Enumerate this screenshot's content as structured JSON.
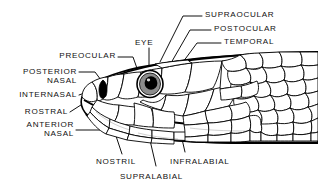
{
  "figure": {
    "background_color": "#ffffff",
    "ink_color": "#000000",
    "width": 318,
    "height": 195
  },
  "labels": {
    "supraocular": "SUPRAOCULAR",
    "postocular": "POSTOCULAR",
    "temporal": "TEMPORAL",
    "eye": "EYE",
    "preocular": "PREOCULAR",
    "posterior_nasal_line1": "POSTERIOR",
    "posterior_nasal_line2": "NASAL",
    "internasal": "INTERNASAL",
    "rostral": "ROSTRAL",
    "anterior_nasal_line1": "ANTERIOR",
    "anterior_nasal_line2": "NASAL",
    "nostril": "NOSTRIL",
    "supralabial": "SUPRALABIAL",
    "infralabial": "INFRALABIAL"
  },
  "anatomy": {
    "eye": {
      "pupil_color": "#000000",
      "iris_color": "#8c8c8c",
      "outline_color": "#000000"
    },
    "nostril": {
      "fill_color": "#000000"
    }
  }
}
